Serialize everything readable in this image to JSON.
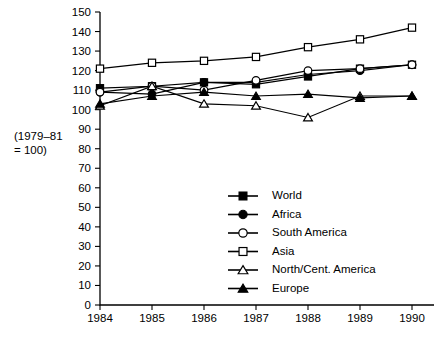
{
  "chart_data": {
    "type": "line",
    "title": "",
    "xlabel": "",
    "ylabel": "(1979–81 = 100)",
    "ylabel_line1": "(1979–81",
    "ylabel_line2": "= 100)",
    "categories": [
      "1984",
      "1985",
      "1986",
      "1987",
      "1988",
      "1989",
      "1990"
    ],
    "x": [
      1984,
      1985,
      1986,
      1987,
      1988,
      1989,
      1990
    ],
    "ylim": [
      0,
      150
    ],
    "yticks": [
      0,
      10,
      20,
      30,
      40,
      50,
      60,
      70,
      80,
      90,
      100,
      110,
      120,
      130,
      140,
      150
    ],
    "ytick_labels": [
      "0",
      "10",
      "20",
      "30",
      "40",
      "50",
      "60",
      "70",
      "80",
      "90",
      "100",
      "110",
      "120",
      "130",
      "140",
      "150"
    ],
    "grid": false,
    "legend_position": "inside-lower-right",
    "series": [
      {
        "name": "World",
        "marker": "filled-square",
        "values": [
          111,
          112,
          114,
          113,
          117,
          121,
          123
        ]
      },
      {
        "name": "Africa",
        "marker": "filled-circle",
        "values": [
          109,
          108,
          114,
          114,
          118,
          120,
          123
        ]
      },
      {
        "name": "South America",
        "marker": "open-circle",
        "values": [
          109,
          112,
          110,
          115,
          120,
          121,
          123
        ]
      },
      {
        "name": "Asia",
        "marker": "open-square",
        "values": [
          121,
          124,
          125,
          127,
          132,
          136,
          142
        ]
      },
      {
        "name": "North/Cent. America",
        "marker": "open-triangle",
        "values": [
          102,
          112,
          103,
          102,
          96,
          107,
          107
        ]
      },
      {
        "name": "Europe",
        "marker": "filled-triangle",
        "values": [
          103,
          107,
          109,
          107,
          108,
          106,
          107
        ]
      }
    ]
  },
  "legend": {
    "items": [
      {
        "label": "World",
        "marker": "filled-square"
      },
      {
        "label": "Africa",
        "marker": "filled-circle"
      },
      {
        "label": "South America",
        "marker": "open-circle"
      },
      {
        "label": "Asia",
        "marker": "open-square"
      },
      {
        "label": "North/Cent. America",
        "marker": "open-triangle"
      },
      {
        "label": "Europe",
        "marker": "filled-triangle"
      }
    ]
  },
  "colors": {
    "ink": "#000000",
    "background": "#ffffff",
    "marker_fill_open": "#ffffff"
  }
}
